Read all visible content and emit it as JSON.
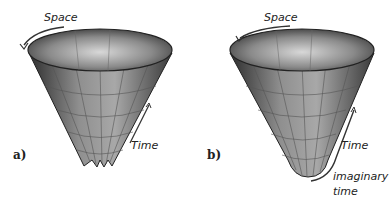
{
  "figure": {
    "panels": [
      {
        "id": "a",
        "panel_label": "a)",
        "space_label": "Space",
        "time_label": "Time",
        "bottom": "jagged singularity"
      },
      {
        "id": "b",
        "panel_label": "b)",
        "space_label": "Space",
        "time_label": "Time",
        "imaginary_label_line1": "imaginary",
        "imaginary_label_line2": "time",
        "bottom": "smooth rounded"
      }
    ]
  }
}
